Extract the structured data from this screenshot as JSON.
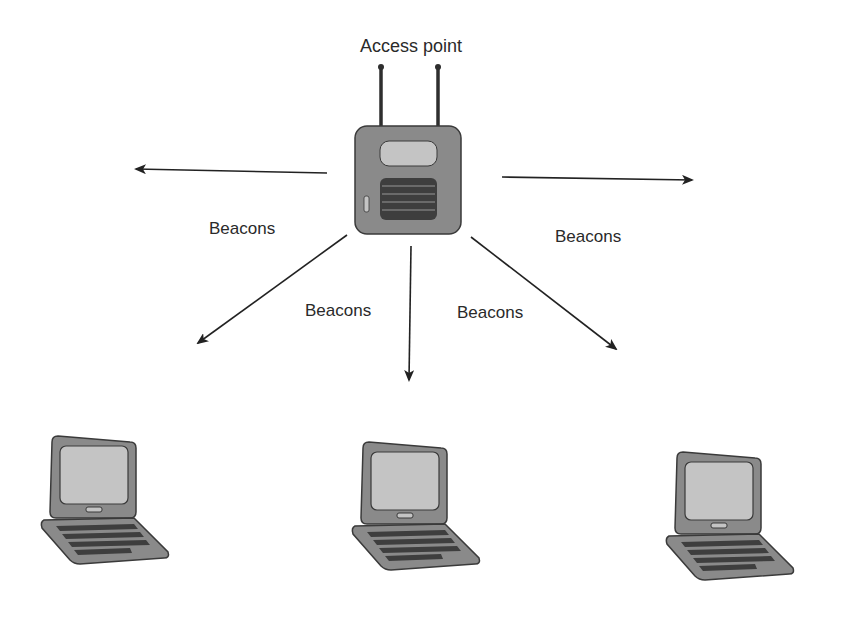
{
  "diagram": {
    "access_point": {
      "label": "Access point",
      "icon": "wireless-access-point-icon"
    },
    "beacon_labels": [
      {
        "id": "left",
        "text": "Beacons"
      },
      {
        "id": "lower-left",
        "text": "Beacons"
      },
      {
        "id": "lower-right",
        "text": "Beacons"
      },
      {
        "id": "right",
        "text": "Beacons"
      }
    ],
    "clients": [
      {
        "id": "laptop-1",
        "icon": "laptop-icon"
      },
      {
        "id": "laptop-2",
        "icon": "laptop-icon"
      },
      {
        "id": "laptop-3",
        "icon": "laptop-icon"
      }
    ],
    "arrows": [
      {
        "id": "arrow-left",
        "direction": "west"
      },
      {
        "id": "arrow-right",
        "direction": "east"
      },
      {
        "id": "arrow-down-left",
        "direction": "southwest"
      },
      {
        "id": "arrow-down",
        "direction": "south"
      },
      {
        "id": "arrow-down-right",
        "direction": "southeast"
      }
    ],
    "colors": {
      "device_body": "#8a8a8a",
      "device_outline": "#3a3a3a",
      "screen": "#c4c4c4",
      "grille": "#3e3e3e",
      "arrow": "#222222"
    }
  }
}
